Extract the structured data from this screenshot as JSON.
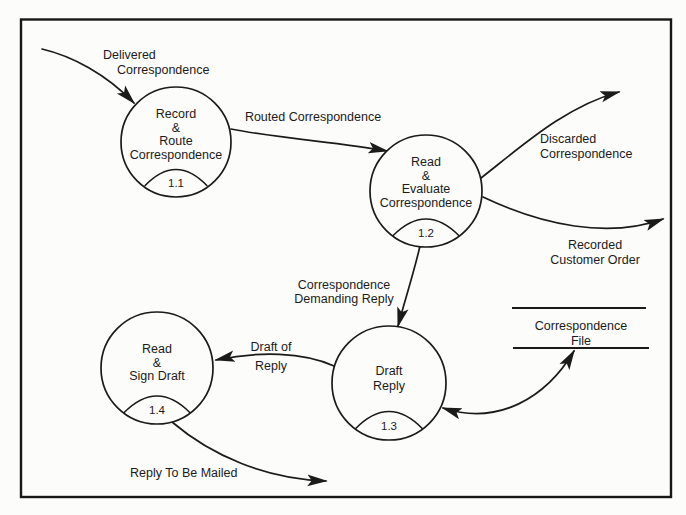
{
  "diagram": {
    "type": "data-flow-diagram",
    "colors": {
      "ink": "#1b1b1b",
      "paper": "#fcfcfa"
    },
    "processes": [
      {
        "number": "1.1",
        "lines": [
          "Record",
          "&",
          "Route",
          "Correspondence"
        ]
      },
      {
        "number": "1.2",
        "lines": [
          "Read",
          "&",
          "Evaluate",
          "Correspondence"
        ]
      },
      {
        "number": "1.3",
        "lines": [
          "Draft",
          "Reply"
        ]
      },
      {
        "number": "1.4",
        "lines": [
          "Read",
          "&",
          "Sign Draft"
        ]
      }
    ],
    "data_store": {
      "lines": [
        "Correspondence",
        "File"
      ]
    },
    "flows": [
      {
        "name": "delivered-correspondence",
        "lines": [
          "Delivered",
          "Correspondence"
        ]
      },
      {
        "name": "routed-correspondence",
        "lines": [
          "Routed Correspondence"
        ]
      },
      {
        "name": "discarded-correspondence",
        "lines": [
          "Discarded",
          "Correspondence"
        ]
      },
      {
        "name": "recorded-customer-order",
        "lines": [
          "Recorded",
          "Customer Order"
        ]
      },
      {
        "name": "correspondence-demanding-reply",
        "lines": [
          "Correspondence",
          "Demanding Reply"
        ]
      },
      {
        "name": "draft-of-reply",
        "lines": [
          "Draft of",
          "Reply"
        ]
      },
      {
        "name": "reply-to-be-mailed",
        "lines": [
          "Reply To Be Mailed"
        ]
      },
      {
        "name": "correspondence-file-access",
        "lines": []
      }
    ]
  }
}
